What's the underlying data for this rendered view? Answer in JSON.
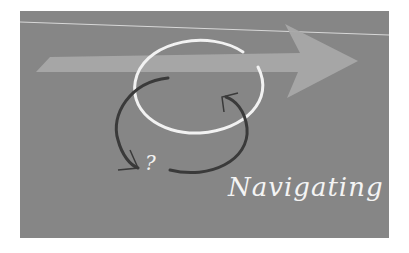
{
  "illustration": {
    "caption": "Navigating",
    "question_mark": "?",
    "colors": {
      "background": "#ffffff",
      "panel": "#868686",
      "arrow": "#a8a8a8",
      "circle": "#f2f2f2",
      "dark_arrows": "#3a3a3a",
      "thin_line": "#d8d8d8"
    }
  }
}
